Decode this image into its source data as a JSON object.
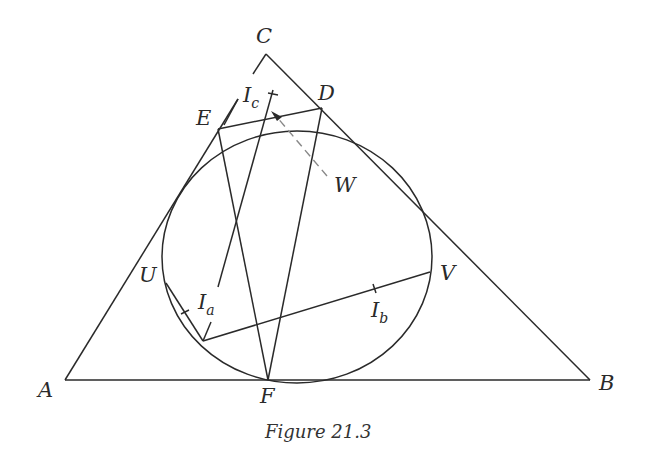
{
  "caption": "Figure 21.3",
  "points": {
    "A": {
      "label": "A"
    },
    "B": {
      "label": "B"
    },
    "C": {
      "label": "C"
    },
    "D": {
      "label": "D"
    },
    "E": {
      "label": "E"
    },
    "F": {
      "label": "F"
    },
    "U": {
      "label": "U"
    },
    "V": {
      "label": "V"
    },
    "W": {
      "label": "W"
    },
    "Ia": {
      "label": "I",
      "sub": "a"
    },
    "Ib": {
      "label": "I",
      "sub": "b"
    },
    "Ic": {
      "label": "I",
      "sub": "c"
    }
  },
  "colors": {
    "stroke": "#2a2a2a",
    "dashed": "#888888"
  }
}
